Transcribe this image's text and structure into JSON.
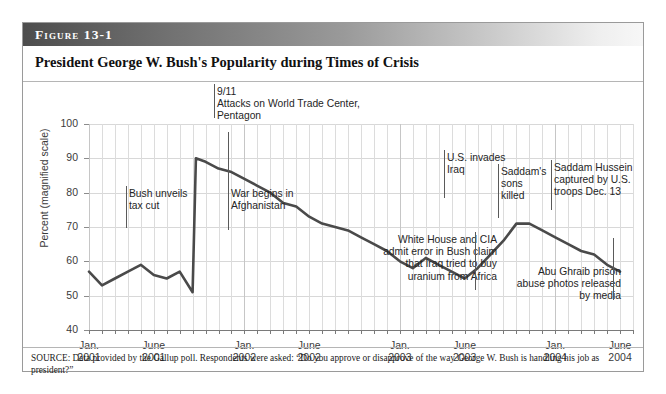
{
  "figure": {
    "label": "Figure 13-1",
    "title": "President George W. Bush's Popularity during Times of Crisis",
    "source_note": "SOURCE: Data provided by the Gallup poll. Respondents were asked: “Do you approve or disapprove of the way George W. Bush is handling his job as president?”"
  },
  "chart_data": {
    "type": "line",
    "title": "President George W. Bush's Popularity during Times of Crisis",
    "xlabel": "",
    "ylabel": "Percent (magnified scale)",
    "ylim": [
      40,
      100
    ],
    "yticks": [
      40,
      50,
      60,
      70,
      80,
      90,
      100
    ],
    "xlim": [
      "2001-01",
      "2004-07"
    ],
    "xtick_labels": [
      {
        "line1": "Jan.",
        "line2": "2001",
        "x": "2001-01"
      },
      {
        "line1": "June",
        "line2": "2001",
        "x": "2001-06"
      },
      {
        "line1": "Jan.",
        "line2": "2002",
        "x": "2002-01"
      },
      {
        "line1": "June",
        "line2": "2002",
        "x": "2002-06"
      },
      {
        "line1": "Jan.",
        "line2": "2003",
        "x": "2003-01"
      },
      {
        "line1": "June",
        "line2": "2003",
        "x": "2003-06"
      },
      {
        "line1": "Jan.",
        "line2": "2004",
        "x": "2004-01"
      },
      {
        "line1": "June",
        "line2": "2004",
        "x": "2004-06"
      }
    ],
    "grid": "both",
    "legend": "none",
    "series": [
      {
        "name": "Presidential approval",
        "color": "#4a4a4a",
        "x": [
          "2001-01",
          "2001-02",
          "2001-03",
          "2001-04",
          "2001-05",
          "2001-06",
          "2001-07",
          "2001-08",
          "2001-09",
          "2001-09b",
          "2001-10",
          "2001-11",
          "2001-12",
          "2002-01",
          "2002-02",
          "2002-03",
          "2002-04",
          "2002-05",
          "2002-06",
          "2002-07",
          "2002-08",
          "2002-09",
          "2002-10",
          "2002-11",
          "2002-12",
          "2003-01",
          "2003-02",
          "2003-03",
          "2003-04",
          "2003-05",
          "2003-06",
          "2003-07",
          "2003-08",
          "2003-09",
          "2003-10",
          "2003-11",
          "2003-12",
          "2004-01",
          "2004-02",
          "2004-03",
          "2004-04",
          "2004-05",
          "2004-06"
        ],
        "values": [
          57,
          53,
          55,
          57,
          59,
          56,
          55,
          57,
          51,
          90,
          89,
          87,
          86,
          84,
          82,
          80,
          77,
          76,
          73,
          71,
          70,
          69,
          67,
          65,
          63,
          60,
          58,
          61,
          59,
          57,
          55,
          58,
          62,
          66,
          71,
          71,
          69,
          67,
          65,
          63,
          62,
          59,
          57
        ]
      }
    ],
    "data_points": [
      {
        "x": "2001-01",
        "y": 57
      },
      {
        "x": "2001-02",
        "y": 53
      },
      {
        "x": "2001-03",
        "y": 55
      },
      {
        "x": "2001-04",
        "y": 57
      },
      {
        "x": "2001-05",
        "y": 59
      },
      {
        "x": "2001-06",
        "y": 56
      },
      {
        "x": "2001-07",
        "y": 55
      },
      {
        "x": "2001-08",
        "y": 57
      },
      {
        "x": "2001-09",
        "y": 51
      },
      {
        "x": "2001-09-post",
        "y": 90
      },
      {
        "x": "2001-10",
        "y": 89
      },
      {
        "x": "2001-11",
        "y": 87
      },
      {
        "x": "2002-01",
        "y": 84
      },
      {
        "x": "2002-03",
        "y": 80
      },
      {
        "x": "2002-05",
        "y": 76
      },
      {
        "x": "2002-06",
        "y": 73
      },
      {
        "x": "2002-08",
        "y": 70
      },
      {
        "x": "2002-10",
        "y": 67
      },
      {
        "x": "2002-12",
        "y": 63
      },
      {
        "x": "2003-01",
        "y": 60
      },
      {
        "x": "2003-02",
        "y": 58
      },
      {
        "x": "2003-03",
        "y": 61
      },
      {
        "x": "2003-05",
        "y": 57
      },
      {
        "x": "2003-06",
        "y": 55
      },
      {
        "x": "2003-07",
        "y": 58
      },
      {
        "x": "2003-09",
        "y": 66
      },
      {
        "x": "2003-11",
        "y": 71
      },
      {
        "x": "2003-12",
        "y": 69
      },
      {
        "x": "2004-02",
        "y": 65
      },
      {
        "x": "2004-04",
        "y": 62
      },
      {
        "x": "2004-05",
        "y": 59
      },
      {
        "x": "2004-06",
        "y": 57
      }
    ],
    "annotations": [
      {
        "id": "tax-cut",
        "text": "Bush unveils\ntax cut",
        "x": "2001-02",
        "align": "left"
      },
      {
        "id": "nine-eleven",
        "text": "9/11\nAttacks on World Trade Center,\nPentagon",
        "x": "2001-09",
        "align": "left"
      },
      {
        "id": "afghanistan",
        "text": "War begins in\nAfghanistan",
        "x": "2001-10",
        "align": "left"
      },
      {
        "id": "iraq-invasion",
        "text": "U.S. invades\nIraq",
        "x": "2003-03",
        "align": "left"
      },
      {
        "id": "uranium-claim",
        "text": "White House and CIA\nadmit error in Bush claim\nthat Iraq tried to buy\nuranium from Africa",
        "x": "2003-07",
        "align": "right"
      },
      {
        "id": "saddam-sons",
        "text": "Saddam's\nsons\nkilled",
        "x": "2003-07",
        "align": "left"
      },
      {
        "id": "abu-ghraib",
        "text": "Abu Ghraib prison\nabuse photos released\nby media",
        "x": "2004-04",
        "align": "right"
      },
      {
        "id": "saddam-captured",
        "text": "Saddam Hussein\ncaptured by U.S.\ntroops Dec. 13",
        "x": "2003-12",
        "align": "left"
      }
    ]
  }
}
